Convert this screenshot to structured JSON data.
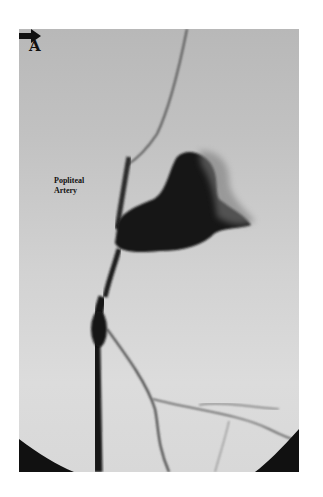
{
  "figure": {
    "panel_label": "A",
    "annotation": {
      "line1": "Popliteal",
      "line2": "Artery",
      "arrow_direction": "right"
    },
    "colors": {
      "background_top": "#b8b8b8",
      "background_bottom": "#dcdcdc",
      "vessel": "#141414"
    }
  }
}
